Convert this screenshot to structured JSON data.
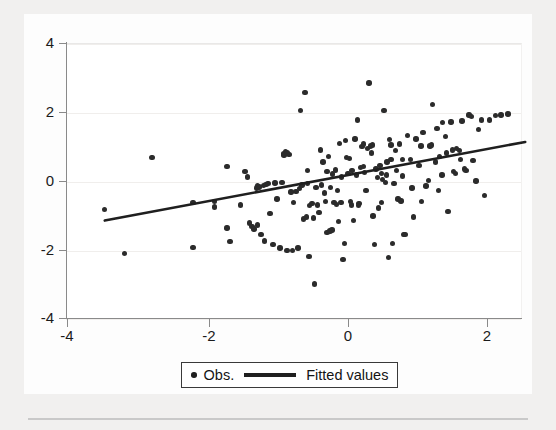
{
  "chart_data": {
    "type": "scatter",
    "title": "",
    "subtitle": "",
    "xlabel": "",
    "ylabel": "",
    "xlim": [
      -4.35,
      2.72
    ],
    "ylim": [
      -4.35,
      4.35
    ],
    "xticks": [
      -4,
      -2,
      0,
      2
    ],
    "xticklabels": [
      "-4",
      "-2",
      "0",
      "2"
    ],
    "yticks": [
      4,
      2,
      0,
      -2,
      -4
    ],
    "yticklabels": [
      "4",
      "2",
      "0",
      "-2",
      "-4"
    ],
    "grid": "horizontal-faint",
    "legend_position": "bottom-center",
    "marker_color": "#2b2b2b",
    "line_color": "#1f1f1f",
    "series": [
      {
        "name": "Obs.",
        "type": "scatter",
        "marker": "filled-circle",
        "points": [
          [
            -3.5,
            -0.82
          ],
          [
            -3.22,
            -2.1
          ],
          [
            -2.82,
            0.68
          ],
          [
            -2.23,
            -1.93
          ],
          [
            -2.23,
            -0.62
          ],
          [
            -1.92,
            -0.6
          ],
          [
            -1.92,
            -0.76
          ],
          [
            -1.74,
            0.42
          ],
          [
            -1.74,
            -1.37
          ],
          [
            -1.7,
            -1.76
          ],
          [
            -1.55,
            -0.7
          ],
          [
            -1.48,
            0.27
          ],
          [
            -1.45,
            0.12
          ],
          [
            -1.42,
            -1.22
          ],
          [
            -1.38,
            -1.32
          ],
          [
            -1.35,
            -1.4
          ],
          [
            -1.32,
            -0.2
          ],
          [
            -1.3,
            -1.28
          ],
          [
            -1.28,
            -0.17
          ],
          [
            -1.25,
            -1.55
          ],
          [
            -1.22,
            -0.13
          ],
          [
            -1.2,
            -1.74
          ],
          [
            -1.18,
            -0.1
          ],
          [
            -1.15,
            -0.08
          ],
          [
            -1.12,
            -0.95
          ],
          [
            -1.08,
            -1.85
          ],
          [
            -1.02,
            -0.52
          ],
          [
            -0.98,
            -1.95
          ],
          [
            -0.95,
            -0.05
          ],
          [
            -0.92,
            0.8
          ],
          [
            -0.9,
            0.85
          ],
          [
            -0.88,
            -2.02
          ],
          [
            -0.85,
            0.78
          ],
          [
            -0.82,
            -0.32
          ],
          [
            -0.8,
            -2.02
          ],
          [
            -0.78,
            -0.62
          ],
          [
            -0.75,
            -0.3
          ],
          [
            -0.72,
            -1.95
          ],
          [
            -0.7,
            -0.22
          ],
          [
            -0.68,
            2.05
          ],
          [
            -0.66,
            -0.12
          ],
          [
            -0.64,
            -1.1
          ],
          [
            -0.62,
            2.58
          ],
          [
            -0.6,
            -1.05
          ],
          [
            -0.58,
            -0.08
          ],
          [
            -0.56,
            -2.2
          ],
          [
            -0.55,
            -0.72
          ],
          [
            -0.52,
            -0.65
          ],
          [
            -0.5,
            -1.08
          ],
          [
            -0.48,
            -3.0
          ],
          [
            -0.46,
            -0.18
          ],
          [
            -0.44,
            -0.7
          ],
          [
            -0.42,
            -0.92
          ],
          [
            -0.4,
            0.9
          ],
          [
            -0.38,
            -0.12
          ],
          [
            -0.36,
            0.55
          ],
          [
            -0.34,
            -0.35
          ],
          [
            -0.32,
            -0.6
          ],
          [
            -0.3,
            -1.5
          ],
          [
            -0.28,
            0.72
          ],
          [
            -0.26,
            -1.45
          ],
          [
            -0.25,
            -0.18
          ],
          [
            -0.23,
            -1.42
          ],
          [
            -0.22,
            0.2
          ],
          [
            -0.2,
            -0.62
          ],
          [
            -0.18,
            0.32
          ],
          [
            -0.17,
            -0.68
          ],
          [
            -0.15,
            -0.28
          ],
          [
            -0.14,
            -1.18
          ],
          [
            -0.12,
            1.1
          ],
          [
            -0.1,
            -0.62
          ],
          [
            -0.09,
            0.12
          ],
          [
            -0.07,
            -2.28
          ],
          [
            -0.05,
            -1.82
          ],
          [
            -0.04,
            1.18
          ],
          [
            -0.02,
            0.68
          ],
          [
            0.0,
            0.22
          ],
          [
            0.02,
            0.65
          ],
          [
            0.04,
            -0.6
          ],
          [
            0.06,
            0.3
          ],
          [
            0.08,
            -1.15
          ],
          [
            0.1,
            1.22
          ],
          [
            0.12,
            0.18
          ],
          [
            0.14,
            1.78
          ],
          [
            0.16,
            -0.65
          ],
          [
            0.18,
            0.4
          ],
          [
            0.2,
            1.0
          ],
          [
            0.22,
            1.08
          ],
          [
            0.24,
            0.25
          ],
          [
            0.26,
            -0.28
          ],
          [
            0.28,
            0.95
          ],
          [
            0.3,
            2.85
          ],
          [
            0.32,
            1.02
          ],
          [
            0.34,
            0.82
          ],
          [
            0.36,
            -1.02
          ],
          [
            0.38,
            -1.85
          ],
          [
            0.4,
            0.35
          ],
          [
            0.42,
            0.1
          ],
          [
            0.44,
            -0.78
          ],
          [
            0.46,
            0.45
          ],
          [
            0.48,
            -0.62
          ],
          [
            0.5,
            0.05
          ],
          [
            0.52,
            2.05
          ],
          [
            0.54,
            -0.05
          ],
          [
            0.56,
            0.55
          ],
          [
            0.58,
            -2.22
          ],
          [
            0.6,
            1.2
          ],
          [
            0.62,
            0.62
          ],
          [
            0.64,
            -1.82
          ],
          [
            0.66,
            -0.08
          ],
          [
            0.68,
            0.88
          ],
          [
            0.7,
            0.3
          ],
          [
            0.72,
            -0.52
          ],
          [
            0.74,
            1.08
          ],
          [
            0.76,
            -0.58
          ],
          [
            0.78,
            0.15
          ],
          [
            0.8,
            -1.55
          ],
          [
            0.82,
            -1.55
          ],
          [
            0.86,
            1.32
          ],
          [
            0.9,
            0.62
          ],
          [
            0.94,
            -1.05
          ],
          [
            0.98,
            1.22
          ],
          [
            1.02,
            0.45
          ],
          [
            1.06,
            -0.6
          ],
          [
            1.08,
            1.42
          ],
          [
            1.12,
            -0.15
          ],
          [
            1.16,
            0.02
          ],
          [
            1.2,
            1.05
          ],
          [
            1.22,
            2.22
          ],
          [
            1.26,
            0.55
          ],
          [
            1.28,
            1.52
          ],
          [
            1.3,
            -0.28
          ],
          [
            1.32,
            0.72
          ],
          [
            1.36,
            1.7
          ],
          [
            1.4,
            1.3
          ],
          [
            1.44,
            -0.88
          ],
          [
            1.48,
            1.72
          ],
          [
            1.52,
            0.28
          ],
          [
            1.56,
            0.95
          ],
          [
            1.6,
            0.88
          ],
          [
            1.64,
            1.75
          ],
          [
            1.68,
            0.35
          ],
          [
            1.7,
            0.3
          ],
          [
            1.74,
            1.92
          ],
          [
            1.78,
            1.88
          ],
          [
            1.8,
            0.6
          ],
          [
            1.84,
            0.0
          ],
          [
            1.88,
            1.5
          ],
          [
            1.92,
            1.78
          ],
          [
            1.96,
            -0.42
          ],
          [
            2.04,
            1.78
          ],
          [
            2.12,
            1.9
          ],
          [
            2.2,
            1.92
          ],
          [
            2.3,
            1.95
          ],
          [
            -0.92,
            0.76
          ],
          [
            -0.88,
            0.82
          ],
          [
            0.22,
            0.42
          ],
          [
            0.48,
            0.22
          ],
          [
            0.55,
            0.18
          ],
          [
            1.42,
            0.82
          ],
          [
            1.5,
            0.9
          ],
          [
            -1.3,
            -0.15
          ],
          [
            -1.05,
            -0.06
          ],
          [
            0.35,
            1.05
          ],
          [
            0.62,
            1.05
          ],
          [
            1.05,
            1.02
          ],
          [
            1.18,
            1.02
          ],
          [
            0.05,
            -0.7
          ],
          [
            0.15,
            -0.72
          ],
          [
            0.92,
            -0.2
          ],
          [
            1.35,
            0.18
          ],
          [
            1.55,
            0.22
          ],
          [
            -0.3,
            0.28
          ],
          [
            -0.58,
            0.3
          ],
          [
            0.78,
            0.62
          ],
          [
            1.62,
            0.62
          ]
        ]
      },
      {
        "name": "Fitted values",
        "type": "line",
        "slope": 0.378,
        "intercept": 0.172,
        "x_range": [
          -3.5,
          2.55
        ],
        "y_range": [
          -1.78,
          1.15
        ]
      }
    ]
  },
  "legend": {
    "obs_label": "Obs.",
    "fitted_label": "Fitted values"
  },
  "axes": {
    "y_labels": [
      "4",
      "2",
      "0",
      "-2",
      "-4"
    ],
    "x_labels": [
      "-4",
      "-2",
      "0",
      "2"
    ]
  }
}
